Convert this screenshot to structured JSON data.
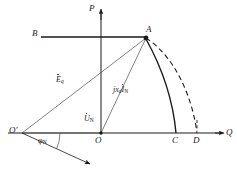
{
  "figure": {
    "type": "phasor-diagram",
    "background_color": "#ffffff",
    "line_color": "#1a1a1a",
    "thin_line_color": "#555555"
  },
  "axes": {
    "vertical": {
      "label": "P",
      "name": "active-power-axis",
      "direction": "up",
      "arrow": true
    },
    "horizontal": {
      "label": "Q",
      "name": "reactive-power-axis",
      "direction": "right",
      "arrow": true
    },
    "origin_label": "O"
  },
  "points": [
    {
      "id": "A",
      "label": "A",
      "role": "operating-point",
      "marked": true
    },
    {
      "id": "B",
      "label": "B",
      "role": "left-endpoint-of-constant-power-line",
      "marked": false
    },
    {
      "id": "C",
      "label": "C",
      "role": "solid-arc-endpoint-on-q-axis",
      "marked": false
    },
    {
      "id": "D",
      "label": "D",
      "role": "dashed-arc-endpoint-on-q-axis",
      "marked": false
    },
    {
      "id": "O",
      "label": "O",
      "role": "origin",
      "marked": true
    },
    {
      "id": "Oprime",
      "label": "O'",
      "role": "excitation-circle-center",
      "marked": false
    }
  ],
  "phasors": [
    {
      "id": "Eq",
      "symbol": "E",
      "subscript": "q",
      "overdot": true,
      "label_text": "Eq",
      "name": "eq-phasor-label",
      "from": "O'",
      "to": "A",
      "description": "internal EMF phasor from O-prime to A"
    },
    {
      "id": "UN",
      "symbol": "U",
      "subscript": "N",
      "overdot": true,
      "label_text": "UN",
      "name": "un-phasor-label",
      "from": "O'",
      "to": "O",
      "description": "rated terminal voltage phasor ending at origin O"
    },
    {
      "id": "jxdIN",
      "symbol": "jx",
      "subscript": "d",
      "symbol2": "I",
      "subscript2": "N",
      "overdot": true,
      "label_text": "jxdIN",
      "name": "jxd-in-phasor-label",
      "from": "O",
      "to": "A",
      "description": "direct axis reactance voltage drop phasor from O to A"
    }
  ],
  "angle": {
    "id": "phiN",
    "symbol": "φ",
    "subscript": "N",
    "label_text": "φN",
    "name": "phi-n-angle-label",
    "at_point": "O'",
    "between": [
      "horizontal from O' to O",
      "current phasor arrow"
    ]
  },
  "curves": [
    {
      "id": "arc-A-C",
      "style": "solid",
      "name": "solid-arc-a-to-c",
      "from": "A",
      "to": "C",
      "description": "solid arc representing excitation limit boundary"
    },
    {
      "id": "arc-A-D",
      "style": "dashed",
      "name": "dashed-arc-a-to-d",
      "from": "A",
      "to": "D",
      "description": "dashed arc representing extended/original excitation circle"
    }
  ],
  "lines": [
    {
      "id": "BA",
      "name": "constant-power-line-b-a",
      "style": "solid",
      "from": "B",
      "to": "A"
    },
    {
      "id": "OprimeA",
      "name": "line-oprime-to-a",
      "style": "thin-solid",
      "from": "O'",
      "to": "A"
    },
    {
      "id": "OprimeO",
      "name": "line-oprime-to-o",
      "style": "thin-solid",
      "from": "O'",
      "to": "O"
    },
    {
      "id": "OA",
      "name": "line-o-to-a",
      "style": "thin-solid",
      "from": "O",
      "to": "A"
    },
    {
      "id": "OprimeCurrent",
      "name": "current-phasor-arrow",
      "style": "thin-solid-arrow",
      "from": "O'",
      "to": "down-right"
    },
    {
      "id": "CD-tick",
      "name": "d-tick-dashed",
      "style": "dashed",
      "from": "D",
      "to": "above-D"
    }
  ]
}
